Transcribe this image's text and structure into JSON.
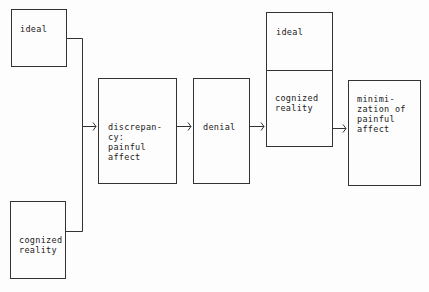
{
  "diagram": {
    "nodes": [
      {
        "id": "ideal_input",
        "label": "ideal"
      },
      {
        "id": "cognized_reality_input",
        "label": "cognized\nreality"
      },
      {
        "id": "discrepancy",
        "label": "discrepan-\ncy:\npainful\naffect"
      },
      {
        "id": "denial",
        "label": "denial"
      },
      {
        "id": "ideal_combined",
        "label": "ideal"
      },
      {
        "id": "cognized_reality_combined",
        "label": "cognized\nreality"
      },
      {
        "id": "minimization",
        "label": "minimi-\nzation of\npainful\naffect"
      }
    ],
    "edges": [
      {
        "from": "ideal_input",
        "to": "discrepancy"
      },
      {
        "from": "cognized_reality_input",
        "to": "discrepancy"
      },
      {
        "from": "discrepancy",
        "to": "denial"
      },
      {
        "from": "denial",
        "to": "ideal_combined/cognized_reality_combined"
      },
      {
        "from": "ideal_combined/cognized_reality_combined",
        "to": "minimization"
      }
    ],
    "colors": {
      "line": "#333333",
      "background": "#fdfdfd",
      "text": "#222222"
    }
  }
}
